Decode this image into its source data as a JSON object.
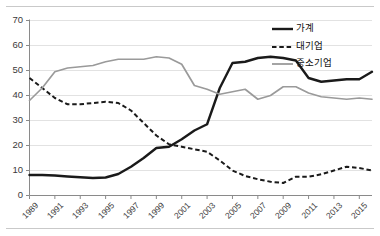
{
  "figure": {
    "background": "#ffffff",
    "top_rule": true,
    "bottom_rule": true
  },
  "legend": {
    "position": "top-right",
    "entries": [
      {
        "label": "가계",
        "style": "solid",
        "color": "#1a1a1a",
        "width": 2.4
      },
      {
        "label": "대기업",
        "style": "dashed",
        "color": "#1a1a1a",
        "width": 2.0
      },
      {
        "label": "중소기업",
        "style": "solid",
        "color": "#9a9a9a",
        "width": 1.8
      }
    ]
  },
  "chart_data": {
    "type": "line",
    "title": "",
    "xlabel": "",
    "ylabel": "",
    "xlim": [
      1989,
      2016
    ],
    "ylim": [
      0,
      70
    ],
    "yticks": [
      0,
      10,
      20,
      30,
      40,
      50,
      60,
      70
    ],
    "xticks": [
      1989,
      1991,
      1993,
      1995,
      1997,
      1999,
      2001,
      2003,
      2005,
      2007,
      2009,
      2011,
      2013,
      2015
    ],
    "grid": "horizontal",
    "legend_position": "top-right",
    "x": [
      1989,
      1990,
      1991,
      1992,
      1993,
      1994,
      1995,
      1996,
      1997,
      1998,
      1999,
      2000,
      2001,
      2002,
      2003,
      2004,
      2005,
      2006,
      2007,
      2008,
      2009,
      2010,
      2011,
      2012,
      2013,
      2014,
      2015,
      2016
    ],
    "series": [
      {
        "name": "가계",
        "color": "#1a1a1a",
        "style": "solid",
        "values": [
          8.2,
          8.2,
          8.0,
          7.6,
          7.3,
          7.0,
          7.2,
          8.6,
          11.5,
          15.0,
          19.0,
          19.5,
          22.5,
          26.0,
          28.5,
          43.0,
          53.0,
          53.5,
          55.0,
          55.5,
          55.0,
          54.0,
          47.0,
          45.5,
          46.0,
          46.5,
          46.5,
          49.5
        ]
      },
      {
        "name": "대기업",
        "color": "#1a1a1a",
        "style": "dashed",
        "values": [
          47.0,
          43.0,
          39.0,
          36.5,
          36.5,
          37.0,
          37.5,
          37.0,
          34.0,
          29.0,
          24.0,
          20.5,
          19.5,
          18.5,
          17.5,
          14.0,
          10.0,
          7.8,
          6.5,
          5.5,
          5.0,
          7.5,
          7.5,
          8.5,
          10.0,
          11.5,
          11.0,
          10.0
        ]
      },
      {
        "name": "중소기업",
        "color": "#9a9a9a",
        "style": "solid",
        "values": [
          38.0,
          43.0,
          49.5,
          51.0,
          51.5,
          52.0,
          53.5,
          54.5,
          54.5,
          54.5,
          55.5,
          55.0,
          52.5,
          44.0,
          42.5,
          40.5,
          41.5,
          42.5,
          38.5,
          40.0,
          43.5,
          43.5,
          41.0,
          39.5,
          39.0,
          38.5,
          39.0,
          38.5
        ]
      }
    ]
  }
}
